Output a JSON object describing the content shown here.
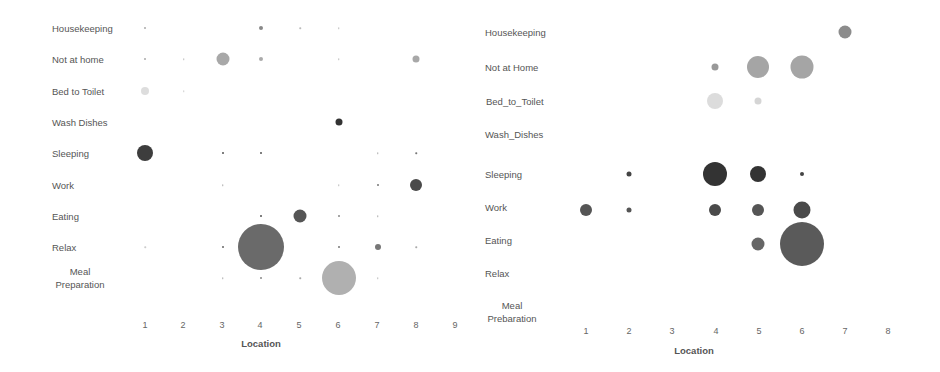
{
  "chart_data": [
    {
      "type": "scatter",
      "subtype": "bubble",
      "title": "",
      "xlabel": "Location",
      "ylabel": "",
      "x_ticks": [
        "1",
        "2",
        "3",
        "4",
        "5",
        "6",
        "7",
        "8",
        "9"
      ],
      "y_categories": [
        "Housekeeping",
        "Not at home",
        "Bed to Toilet",
        "Wash Dishes",
        "Sleeping",
        "Work",
        "Eating",
        "Relax",
        "Meal Preparation"
      ],
      "grid": false,
      "points": [
        {
          "activity": "Housekeeping",
          "location": 1,
          "size": 2,
          "color": "#aaaaaa"
        },
        {
          "activity": "Housekeeping",
          "location": 4,
          "size": 4,
          "color": "#888888"
        },
        {
          "activity": "Housekeeping",
          "location": 5,
          "size": 1.5,
          "color": "#bbbbbb"
        },
        {
          "activity": "Housekeeping",
          "location": 6,
          "size": 1.5,
          "color": "#bbbbbb"
        },
        {
          "activity": "Not at home",
          "location": 1,
          "size": 2,
          "color": "#aaaaaa"
        },
        {
          "activity": "Not at home",
          "location": 2,
          "size": 1.5,
          "color": "#bbbbbb"
        },
        {
          "activity": "Not at home",
          "location": 3,
          "size": 13,
          "color": "#a8a8a8"
        },
        {
          "activity": "Not at home",
          "location": 4,
          "size": 4,
          "color": "#aaaaaa"
        },
        {
          "activity": "Not at home",
          "location": 6,
          "size": 1.5,
          "color": "#bbbbbb"
        },
        {
          "activity": "Not at home",
          "location": 8,
          "size": 7,
          "color": "#a8a8a8"
        },
        {
          "activity": "Bed to Toilet",
          "location": 1,
          "size": 8,
          "color": "#dddddd"
        },
        {
          "activity": "Bed to Toilet",
          "location": 2,
          "size": 1.5,
          "color": "#cccccc"
        },
        {
          "activity": "Wash Dishes",
          "location": 6,
          "size": 7,
          "color": "#333333"
        },
        {
          "activity": "Sleeping",
          "location": 1,
          "size": 16,
          "color": "#3d3d3d"
        },
        {
          "activity": "Sleeping",
          "location": 3,
          "size": 2,
          "color": "#555555"
        },
        {
          "activity": "Sleeping",
          "location": 4,
          "size": 2,
          "color": "#555555"
        },
        {
          "activity": "Sleeping",
          "location": 7,
          "size": 1.5,
          "color": "#aaaaaa"
        },
        {
          "activity": "Sleeping",
          "location": 8,
          "size": 1.5,
          "color": "#777777"
        },
        {
          "activity": "Work",
          "location": 3,
          "size": 1.5,
          "color": "#aaaaaa"
        },
        {
          "activity": "Work",
          "location": 6,
          "size": 1.5,
          "color": "#bbbbbb"
        },
        {
          "activity": "Work",
          "location": 7,
          "size": 2,
          "color": "#777777"
        },
        {
          "activity": "Work",
          "location": 8,
          "size": 12,
          "color": "#4a4a4a"
        },
        {
          "activity": "Eating",
          "location": 4,
          "size": 2,
          "color": "#555555"
        },
        {
          "activity": "Eating",
          "location": 5,
          "size": 13,
          "color": "#555555"
        },
        {
          "activity": "Eating",
          "location": 6,
          "size": 2,
          "color": "#888888"
        },
        {
          "activity": "Eating",
          "location": 7,
          "size": 1.5,
          "color": "#aaaaaa"
        },
        {
          "activity": "Relax",
          "location": 1,
          "size": 1.5,
          "color": "#cccccc"
        },
        {
          "activity": "Relax",
          "location": 3,
          "size": 2,
          "color": "#666666"
        },
        {
          "activity": "Relax",
          "location": 4,
          "size": 46,
          "color": "#6a6a6a"
        },
        {
          "activity": "Relax",
          "location": 6,
          "size": 2,
          "color": "#777777"
        },
        {
          "activity": "Relax",
          "location": 7,
          "size": 6,
          "color": "#777777"
        },
        {
          "activity": "Relax",
          "location": 8,
          "size": 1.5,
          "color": "#aaaaaa"
        },
        {
          "activity": "Meal Preparation",
          "location": 3,
          "size": 1.5,
          "color": "#aaaaaa"
        },
        {
          "activity": "Meal Preparation",
          "location": 4,
          "size": 2,
          "color": "#888888"
        },
        {
          "activity": "Meal Preparation",
          "location": 5,
          "size": 1.5,
          "color": "#aaaaaa"
        },
        {
          "activity": "Meal Preparation",
          "location": 6,
          "size": 34,
          "color": "#b0b0b0"
        },
        {
          "activity": "Meal Preparation",
          "location": 7,
          "size": 1.5,
          "color": "#bbbbbb"
        }
      ]
    },
    {
      "type": "scatter",
      "subtype": "bubble",
      "title": "",
      "xlabel": "Location",
      "ylabel": "",
      "x_ticks": [
        "1",
        "2",
        "3",
        "4",
        "5",
        "6",
        "7",
        "8"
      ],
      "y_categories": [
        "Housekeeping",
        "Not at Home",
        "Bed_to_Toilet",
        "Wash_Dishes",
        "Sleeping",
        "Work",
        "Eating",
        "Relax",
        "Meal Prebaration"
      ],
      "grid": false,
      "points": [
        {
          "activity": "Housekeeping",
          "location": 7,
          "size": 13,
          "color": "#8c8c8c"
        },
        {
          "activity": "Not at Home",
          "location": 4,
          "size": 7,
          "color": "#999999"
        },
        {
          "activity": "Not at Home",
          "location": 5,
          "size": 22,
          "color": "#a5a5a5"
        },
        {
          "activity": "Not at Home",
          "location": 6,
          "size": 23,
          "color": "#a5a5a5"
        },
        {
          "activity": "Bed_to_Toilet",
          "location": 4,
          "size": 16,
          "color": "#dcdcdc"
        },
        {
          "activity": "Bed_to_Toilet",
          "location": 5,
          "size": 7,
          "color": "#d5d5d5"
        },
        {
          "activity": "Sleeping",
          "location": 2,
          "size": 5,
          "color": "#444444"
        },
        {
          "activity": "Sleeping",
          "location": 4,
          "size": 24,
          "color": "#333333"
        },
        {
          "activity": "Sleeping",
          "location": 5,
          "size": 16,
          "color": "#333333"
        },
        {
          "activity": "Sleeping",
          "location": 6,
          "size": 4,
          "color": "#444444"
        },
        {
          "activity": "Work",
          "location": 1,
          "size": 12,
          "color": "#555555"
        },
        {
          "activity": "Work",
          "location": 2,
          "size": 5,
          "color": "#555555"
        },
        {
          "activity": "Work",
          "location": 4,
          "size": 12,
          "color": "#4a4a4a"
        },
        {
          "activity": "Work",
          "location": 5,
          "size": 12,
          "color": "#555555"
        },
        {
          "activity": "Work",
          "location": 6,
          "size": 17,
          "color": "#4a4a4a"
        },
        {
          "activity": "Eating",
          "location": 5,
          "size": 13,
          "color": "#666666"
        },
        {
          "activity": "Eating",
          "location": 6,
          "size": 44,
          "color": "#5a5a5a"
        }
      ]
    }
  ]
}
